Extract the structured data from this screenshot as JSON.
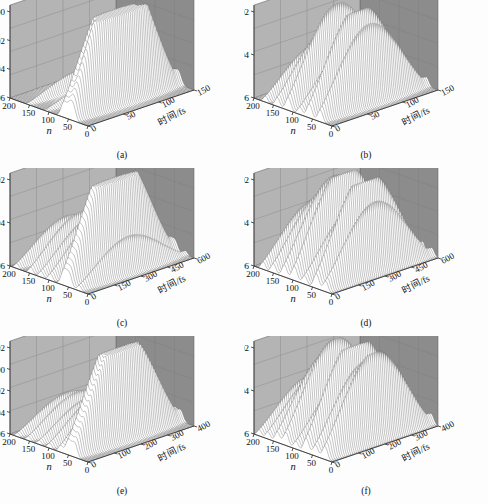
{
  "figure": {
    "type": "multi-panel-3d-waterfall",
    "panel_count": 6,
    "shared": {
      "zlabel": "δ",
      "xlabel": "n",
      "ylabel": "时间/fs",
      "xticks": [
        "200",
        "150",
        "100",
        "50",
        "0"
      ],
      "wall_back_color": "#8c8c8c",
      "wall_left_color": "#b4b4b4",
      "floor_color": "#fafafa",
      "ridge_color": "#ffffff",
      "ridge_stroke": "#6e6e6e"
    }
  },
  "panels": [
    {
      "id": "a",
      "caption": "(a)",
      "zticks": [
        "0.00",
        "0.02",
        "0.04",
        "0.06"
      ],
      "yticks": [
        "0",
        "50",
        "100",
        "150"
      ],
      "ymax": 150
    },
    {
      "id": "b",
      "caption": "(b)",
      "zticks": [
        "0.02",
        "0.04",
        "0.06"
      ],
      "yticks": [
        "0",
        "50",
        "100",
        "150"
      ],
      "ymax": 150
    },
    {
      "id": "c",
      "caption": "(c)",
      "zticks": [
        "0.02",
        "0.04",
        "0.06"
      ],
      "yticks": [
        "0",
        "150",
        "300",
        "450",
        "600"
      ],
      "ymax": 600
    },
    {
      "id": "d",
      "caption": "(d)",
      "zticks": [
        "0.02",
        "0.04",
        "0.06"
      ],
      "yticks": [
        "0",
        "150",
        "300",
        "450",
        "600"
      ],
      "ymax": 600
    },
    {
      "id": "e",
      "caption": "(e)",
      "zticks": [
        "- 0.02",
        "0.00",
        "0.02",
        "0.04",
        "0.06"
      ],
      "yticks": [
        "0",
        "100",
        "200",
        "300",
        "400"
      ],
      "ymax": 400
    },
    {
      "id": "f",
      "caption": "(f)",
      "zticks": [
        "0.02",
        "0.04",
        "0.06"
      ],
      "yticks": [
        "0",
        "100",
        "200",
        "300",
        "400"
      ],
      "ymax": 400
    }
  ],
  "chart_data": {
    "type": "line",
    "title": "",
    "xlabel": "n",
    "ylabel": "时间/fs",
    "zlabel": "δ",
    "note": "Six 3D waterfall surfaces of δ versus site index n and time (fs). Each panel stacks ~60 time-slice profiles; z axis is drawn inverted (0.00 at top, 0.06 at bottom).",
    "xlim": [
      200,
      0
    ],
    "series": [
      {
        "name": "a",
        "ylim": [
          0,
          150
        ],
        "zlim": [
          0.0,
          0.06
        ],
        "peaks": [
          {
            "n": 62,
            "amp": 1.0
          },
          {
            "n": 48,
            "amp": 0.74
          },
          {
            "n": 38,
            "amp": 0.95
          },
          {
            "n": 150,
            "amp": 0.16
          },
          {
            "n": 105,
            "amp": 0.13
          }
        ]
      },
      {
        "name": "b",
        "ylim": [
          0,
          150
        ],
        "zlim": [
          0.02,
          0.06
        ],
        "peaks": [
          {
            "n": 170,
            "amp": 0.4
          },
          {
            "n": 140,
            "amp": 0.58
          },
          {
            "n": 112,
            "amp": 0.86
          },
          {
            "n": 82,
            "amp": 0.5
          },
          {
            "n": 58,
            "amp": 0.92
          },
          {
            "n": 30,
            "amp": 0.78
          }
        ]
      },
      {
        "name": "c",
        "ylim": [
          0,
          600
        ],
        "zlim": [
          0.02,
          0.06
        ],
        "peaks": [
          {
            "n": 182,
            "amp": 0.34
          },
          {
            "n": 146,
            "amp": 0.42
          },
          {
            "n": 120,
            "amp": 0.4
          },
          {
            "n": 96,
            "amp": 0.45
          },
          {
            "n": 62,
            "amp": 1.0
          },
          {
            "n": 48,
            "amp": 0.88
          },
          {
            "n": 22,
            "amp": 0.36
          }
        ]
      },
      {
        "name": "d",
        "ylim": [
          0,
          600
        ],
        "zlim": [
          0.02,
          0.06
        ],
        "peaks": [
          {
            "n": 176,
            "amp": 0.5
          },
          {
            "n": 150,
            "amp": 0.62
          },
          {
            "n": 122,
            "amp": 0.8
          },
          {
            "n": 96,
            "amp": 0.94
          },
          {
            "n": 70,
            "amp": 0.58
          },
          {
            "n": 40,
            "amp": 0.96
          },
          {
            "n": 16,
            "amp": 0.7
          }
        ]
      },
      {
        "name": "e",
        "ylim": [
          0,
          400
        ],
        "zlim": [
          -0.02,
          0.06
        ],
        "peaks": [
          {
            "n": 180,
            "amp": 0.26
          },
          {
            "n": 152,
            "amp": 0.3
          },
          {
            "n": 124,
            "amp": 0.28
          },
          {
            "n": 98,
            "amp": 0.34
          },
          {
            "n": 70,
            "amp": 0.44
          },
          {
            "n": 50,
            "amp": 1.0
          },
          {
            "n": 34,
            "amp": 0.92
          }
        ]
      },
      {
        "name": "f",
        "ylim": [
          0,
          400
        ],
        "zlim": [
          0.02,
          0.06
        ],
        "peaks": [
          {
            "n": 186,
            "amp": 0.42
          },
          {
            "n": 164,
            "amp": 0.48
          },
          {
            "n": 140,
            "amp": 0.7
          },
          {
            "n": 118,
            "amp": 0.86
          },
          {
            "n": 92,
            "amp": 0.52
          },
          {
            "n": 66,
            "amp": 0.96
          },
          {
            "n": 42,
            "amp": 0.74
          },
          {
            "n": 18,
            "amp": 0.88
          }
        ]
      }
    ]
  }
}
